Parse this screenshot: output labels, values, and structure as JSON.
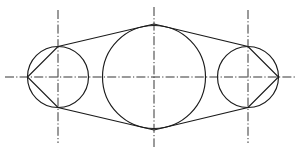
{
  "drawing": {
    "title": "Three-circle tangent outline engineering sketch",
    "canvas": {
      "width": 301,
      "height": 153,
      "background": "#ffffff"
    },
    "style": {
      "outline_color": "#1a1a1a",
      "outline_width": 1.15,
      "centerline_color": "#2b2b2b",
      "centerline_width": 0.95,
      "centerline_dash": "9 2.2 1.2 2.2"
    },
    "circles": [
      {
        "name": "left-circle",
        "cx": 58,
        "cy": 77,
        "r": 30.5
      },
      {
        "name": "middle-circle",
        "cx": 154,
        "cy": 77,
        "r": 51.5
      },
      {
        "name": "right-circle",
        "cx": 248,
        "cy": 77,
        "r": 30.5
      }
    ],
    "outline_path": "M 58 46.5 L 154 24 L 248 46.5 L 278.5 77 L 248 107.5 L 154 130 L 58 107.5 L 27.5 77 Z",
    "centerlines": {
      "horizontal": {
        "name": "horizontal-centerline",
        "x1": 5,
        "y1": 77,
        "x2": 296,
        "y2": 77
      },
      "vertical": [
        {
          "name": "left-vertical-centerline",
          "x": 58,
          "y1": 10,
          "y2": 143
        },
        {
          "name": "middle-vertical-centerline",
          "x": 154,
          "y1": 7,
          "y2": 147
        },
        {
          "name": "right-vertical-centerline",
          "x": 248,
          "y1": 10,
          "y2": 143
        }
      ]
    }
  }
}
